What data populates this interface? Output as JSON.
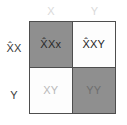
{
  "figure": {
    "type": "punnett-square",
    "rows": 2,
    "columns": 2
  },
  "colors": {
    "shaded_cell": "#8f8f8f",
    "plain_cell": "#fdfdfd",
    "grid_line": "#4e4e4e",
    "column_header_text": "#dadada",
    "row_header_text": "#3a3a3a",
    "background": "#ffffff"
  },
  "column_headers": [
    {
      "label": "X",
      "name": "column-header-x"
    },
    {
      "label": "Y",
      "name": "column-header-y"
    }
  ],
  "row_headers": [
    {
      "label": "X̂X",
      "name": "row-header-x-hat-x"
    },
    {
      "label": "Y",
      "name": "row-header-y"
    }
  ],
  "cells": [
    {
      "id": "cell-0-0",
      "row": 0,
      "column": 0,
      "genotype": "X̂Xx",
      "shaded": true
    },
    {
      "id": "cell-0-1",
      "row": 0,
      "column": 1,
      "genotype": "X̂XY",
      "shaded": false
    },
    {
      "id": "cell-1-0",
      "row": 1,
      "column": 0,
      "genotype": "XY",
      "shaded": false
    },
    {
      "id": "cell-1-1",
      "row": 1,
      "column": 1,
      "genotype": "YY",
      "shaded": true
    }
  ]
}
